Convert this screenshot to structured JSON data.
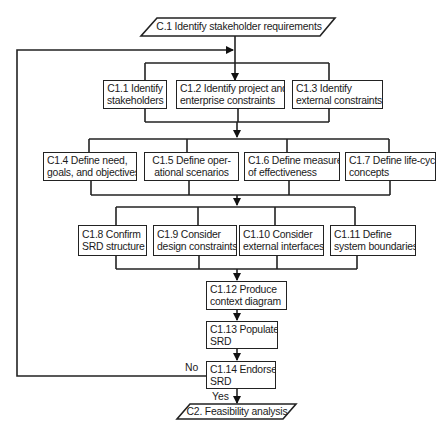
{
  "diagram": {
    "type": "flowchart",
    "start": {
      "id": "C.1",
      "label": "C.1  Identify stakeholder requirements"
    },
    "end": {
      "id": "C2",
      "label": "C2. Feasibility analysis"
    },
    "rows": [
      {
        "nodes": [
          {
            "id": "C1.1",
            "lines": [
              "C1.1 Identify",
              "stakeholders"
            ]
          },
          {
            "id": "C1.2",
            "lines": [
              "C1.2 Identify project and",
              "enterprise constraints"
            ]
          },
          {
            "id": "C1.3",
            "lines": [
              "C1.3 Identify",
              "external constraints"
            ]
          }
        ]
      },
      {
        "nodes": [
          {
            "id": "C1.4",
            "lines": [
              "C1.4 Define need,",
              "goals, and objectives"
            ]
          },
          {
            "id": "C1.5",
            "lines": [
              "C1.5 Define oper-",
              "ational scenarios"
            ]
          },
          {
            "id": "C1.6",
            "lines": [
              "C1.6 Define measures",
              "of effectiveness"
            ]
          },
          {
            "id": "C1.7",
            "lines": [
              "C1.7 Define life-cycle",
              "concepts"
            ]
          }
        ]
      },
      {
        "nodes": [
          {
            "id": "C1.8",
            "lines": [
              "C1.8 Confirm",
              "SRD structure"
            ]
          },
          {
            "id": "C1.9",
            "lines": [
              "C1.9 Consider",
              "design constraints"
            ]
          },
          {
            "id": "C1.10",
            "lines": [
              "C1.10 Consider",
              "external interfaces"
            ]
          },
          {
            "id": "C1.11",
            "lines": [
              "C1.11 Define",
              "system boundaries"
            ]
          }
        ]
      }
    ],
    "sequence": [
      {
        "id": "C1.12",
        "lines": [
          "C1.12 Produce",
          "context diagram"
        ]
      },
      {
        "id": "C1.13",
        "lines": [
          "C1.13 Populate",
          "SRD"
        ]
      },
      {
        "id": "C1.14",
        "lines": [
          "C1.14 Endorse",
          "SRD"
        ]
      }
    ],
    "decision_labels": {
      "no": "No",
      "yes": "Yes"
    },
    "edges": [
      {
        "from": "C.1",
        "to": "row1"
      },
      {
        "from": "row1",
        "to": "row2"
      },
      {
        "from": "row2",
        "to": "row3"
      },
      {
        "from": "row3",
        "to": "C1.12"
      },
      {
        "from": "C1.12",
        "to": "C1.13"
      },
      {
        "from": "C1.13",
        "to": "C1.14"
      },
      {
        "from": "C1.14",
        "to": "C2",
        "label": "Yes"
      },
      {
        "from": "C1.14",
        "to": "row1",
        "label": "No"
      }
    ]
  }
}
